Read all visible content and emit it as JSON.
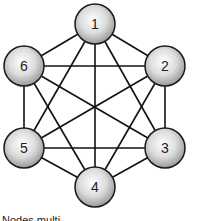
{
  "diagram": {
    "type": "complete-graph",
    "nodes": [
      {
        "id": "1",
        "label": "1",
        "x": 95,
        "y": 24
      },
      {
        "id": "2",
        "label": "2",
        "x": 165,
        "y": 66
      },
      {
        "id": "3",
        "label": "3",
        "x": 165,
        "y": 148
      },
      {
        "id": "4",
        "label": "4",
        "x": 95,
        "y": 187
      },
      {
        "id": "5",
        "label": "5",
        "x": 24,
        "y": 148
      },
      {
        "id": "6",
        "label": "6",
        "x": 24,
        "y": 66
      }
    ],
    "edges": [
      [
        "1",
        "2"
      ],
      [
        "1",
        "3"
      ],
      [
        "1",
        "4"
      ],
      [
        "1",
        "5"
      ],
      [
        "1",
        "6"
      ],
      [
        "2",
        "3"
      ],
      [
        "2",
        "4"
      ],
      [
        "2",
        "5"
      ],
      [
        "2",
        "6"
      ],
      [
        "3",
        "4"
      ],
      [
        "3",
        "5"
      ],
      [
        "3",
        "6"
      ],
      [
        "4",
        "5"
      ],
      [
        "4",
        "6"
      ],
      [
        "5",
        "6"
      ]
    ],
    "node_radius": 20,
    "colors": {
      "edge": "#111111",
      "node_stroke": "#1a1a1a",
      "node_fill_light": "#ffffff",
      "node_fill_dark": "#9a9a9a",
      "label": "#222222"
    }
  },
  "caption": {
    "text": "Nodes multi..."
  }
}
